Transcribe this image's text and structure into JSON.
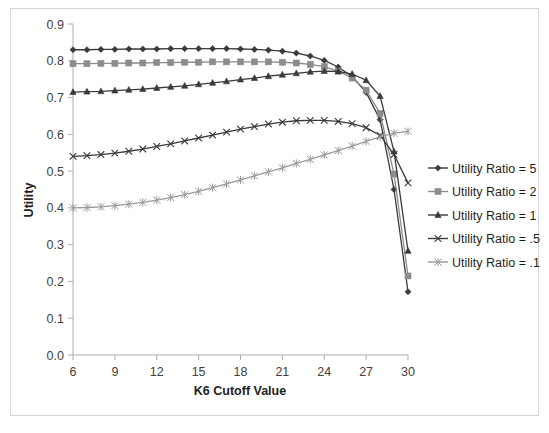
{
  "chart_data": {
    "type": "line",
    "title": "",
    "xlabel": "K6 Cutoff Value",
    "ylabel": "Utility",
    "xlim": [
      6,
      30
    ],
    "ylim": [
      0.0,
      0.9
    ],
    "xticks": [
      6,
      9,
      12,
      15,
      18,
      21,
      24,
      27,
      30
    ],
    "xtick_labels": [
      "6",
      "9",
      "12",
      "15",
      "18",
      "21",
      "24",
      "27",
      "30"
    ],
    "yticks": [
      0.0,
      0.1,
      0.2,
      0.3,
      0.4,
      0.5,
      0.6,
      0.7,
      0.8,
      0.9
    ],
    "ytick_labels": [
      "0.0",
      "0.1",
      "0.2",
      "0.3",
      "0.4",
      "0.5",
      "0.6",
      "0.7",
      "0.8",
      "0.9"
    ],
    "grid": false,
    "legend_position": "right",
    "x": [
      6,
      7,
      8,
      9,
      10,
      11,
      12,
      13,
      14,
      15,
      16,
      17,
      18,
      19,
      20,
      21,
      22,
      23,
      24,
      25,
      26,
      27,
      28,
      29,
      30
    ],
    "series": [
      {
        "name": "Utility Ratio = 5",
        "marker": "diamond",
        "color": "#3a3a3a",
        "values": [
          0.83,
          0.83,
          0.831,
          0.831,
          0.832,
          0.832,
          0.832,
          0.833,
          0.833,
          0.833,
          0.833,
          0.833,
          0.832,
          0.831,
          0.829,
          0.826,
          0.821,
          0.813,
          0.801,
          0.783,
          0.757,
          0.714,
          0.64,
          0.45,
          0.172
        ]
      },
      {
        "name": "Utility Ratio = 2",
        "marker": "square",
        "color": "#8c8c8c",
        "values": [
          0.792,
          0.792,
          0.793,
          0.793,
          0.794,
          0.794,
          0.795,
          0.795,
          0.796,
          0.796,
          0.797,
          0.797,
          0.797,
          0.797,
          0.797,
          0.796,
          0.794,
          0.79,
          0.784,
          0.772,
          0.753,
          0.72,
          0.657,
          0.492,
          0.215
        ]
      },
      {
        "name": "Utility Ratio = 1",
        "marker": "triangle",
        "color": "#3a3a3a",
        "values": [
          0.715,
          0.716,
          0.717,
          0.719,
          0.721,
          0.723,
          0.726,
          0.729,
          0.732,
          0.736,
          0.74,
          0.744,
          0.749,
          0.753,
          0.758,
          0.762,
          0.766,
          0.77,
          0.772,
          0.771,
          0.764,
          0.747,
          0.704,
          0.553,
          0.283
        ]
      },
      {
        "name": "Utility Ratio = .5",
        "marker": "cross",
        "color": "#3a3a3a",
        "values": [
          0.54,
          0.542,
          0.545,
          0.549,
          0.554,
          0.56,
          0.567,
          0.574,
          0.582,
          0.59,
          0.598,
          0.606,
          0.614,
          0.621,
          0.628,
          0.633,
          0.637,
          0.638,
          0.638,
          0.635,
          0.629,
          0.618,
          0.597,
          0.545,
          0.468
        ]
      },
      {
        "name": "Utility Ratio = .1",
        "marker": "asterisk",
        "color": "#999999",
        "values": [
          0.4,
          0.401,
          0.403,
          0.406,
          0.41,
          0.415,
          0.421,
          0.428,
          0.436,
          0.445,
          0.455,
          0.465,
          0.476,
          0.487,
          0.498,
          0.509,
          0.521,
          0.532,
          0.544,
          0.556,
          0.568,
          0.581,
          0.593,
          0.603,
          0.608
        ]
      }
    ]
  }
}
